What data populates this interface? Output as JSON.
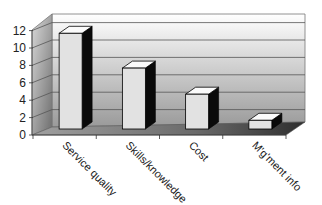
{
  "chart_data": {
    "type": "bar",
    "style": "3d-column",
    "title": "",
    "xlabel": "",
    "ylabel": "",
    "categories": [
      "Service quality",
      "Skills/knowledge",
      "Cost",
      "M'g'ment info"
    ],
    "values": [
      11,
      7,
      4,
      1
    ],
    "ylim": [
      0,
      12
    ],
    "yticks": [
      "0",
      "2",
      "4",
      "6",
      "8",
      "10",
      "12"
    ],
    "grid": true,
    "legend": null
  },
  "colors": {
    "bar_front": "#e2e2e2",
    "bar_top": "#fbfbfb",
    "bar_side": "#0a0a0a",
    "wall_top": "#ffffff",
    "wall_bottom": "#9a9a9a",
    "side_wall_light": "#d8d8d8",
    "side_wall_dark": "#7a7a7a",
    "floor_light": "#8c8c8c",
    "floor_dark": "#3a3a3a",
    "gridline": "#555555"
  }
}
